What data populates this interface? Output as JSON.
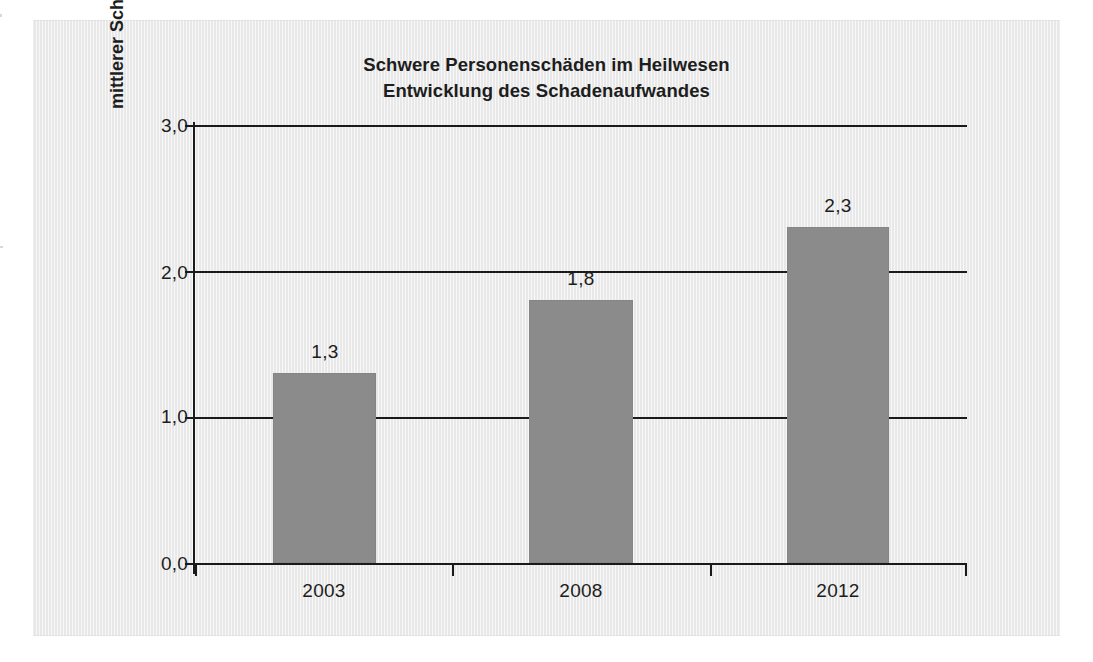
{
  "chart_data": {
    "type": "bar",
    "title": "Schwere Personenschäden im Heilwesen",
    "subtitle": "Entwicklung des Schadenaufwandes",
    "xlabel": "",
    "ylabel": "mittlerer Schadenaufwand in Milo. Euro",
    "categories": [
      "2003",
      "2008",
      "2012"
    ],
    "values": [
      1.3,
      1.8,
      2.3
    ],
    "value_labels": [
      "1,3",
      "1,8",
      "2,3"
    ],
    "ylim": [
      0.0,
      3.0
    ],
    "ytick_values": [
      0.0,
      1.0,
      2.0,
      3.0
    ],
    "ytick_labels": [
      "0,0",
      "1,0",
      "2,0",
      "3,0"
    ],
    "grid": "horizontal",
    "legend": "none",
    "series": [
      {
        "name": "mittlerer Schadenaufwand",
        "values": [
          1.3,
          1.8,
          2.3
        ],
        "color": "#8b8b8b"
      }
    ]
  },
  "colors": {
    "bar_fill": "#8b8b8b",
    "axis": "#1a1a1a",
    "text": "#1d1d1d",
    "panel_background": "#efefef",
    "page_background": "#ffffff"
  }
}
